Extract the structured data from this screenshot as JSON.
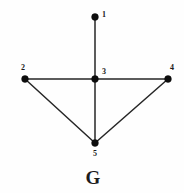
{
  "figure": {
    "caption": "G",
    "caption_x": 93,
    "caption_y": 184,
    "background_color": "#fefefe",
    "ink_color": "#1a1a1a"
  },
  "chart_data": {
    "type": "diagram",
    "diagram_kind": "undirected-graph",
    "title": "G",
    "node_count": 5,
    "edge_count": 6,
    "nodes": [
      {
        "id": "1",
        "label": "1",
        "x": 95,
        "y": 17,
        "label_x": 102,
        "label_y": 17,
        "degree": 1
      },
      {
        "id": "2",
        "label": "2",
        "x": 25,
        "y": 79,
        "label_x": 21,
        "label_y": 70,
        "degree": 2
      },
      {
        "id": "3",
        "label": "3",
        "x": 95,
        "y": 79,
        "label_x": 102,
        "label_y": 74,
        "degree": 4
      },
      {
        "id": "4",
        "label": "4",
        "x": 168,
        "y": 79,
        "label_x": 170,
        "label_y": 70,
        "degree": 2
      },
      {
        "id": "5",
        "label": "5",
        "x": 95,
        "y": 143,
        "label_x": 95,
        "label_y": 156,
        "degree": 3
      }
    ],
    "edges": [
      {
        "source": "1",
        "target": "3"
      },
      {
        "source": "2",
        "target": "3"
      },
      {
        "source": "3",
        "target": "4"
      },
      {
        "source": "3",
        "target": "5"
      },
      {
        "source": "2",
        "target": "5"
      },
      {
        "source": "4",
        "target": "5"
      }
    ],
    "node_radius": 3.4,
    "edge_width": 1.5,
    "xlim": [
      0,
      184
    ],
    "ylim": [
      0,
      193
    ],
    "grid": false,
    "legend": null
  }
}
